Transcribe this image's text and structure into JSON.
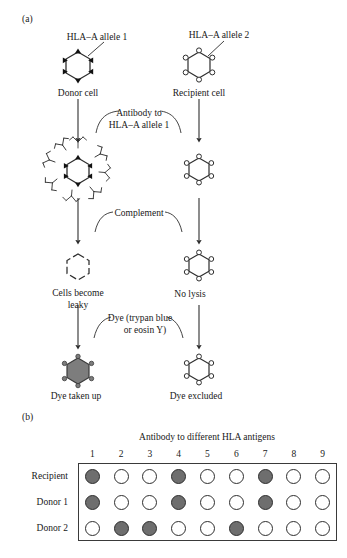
{
  "figure": {
    "panel_a": {
      "tag": "(a)",
      "labels": {
        "allele1": "HLA–A allele 1",
        "allele2": "HLA–A allele 2",
        "donor_cell": "Donor cell",
        "recipient_cell": "Recipient cell",
        "step1_line1": "Antibody to",
        "step1_line2": "HLA–A allele 1",
        "step2": "Complement",
        "left_outcome_line1": "Cells become",
        "left_outcome_line2": "leaky",
        "right_outcome": "No lysis",
        "step3_line1": "Dye (trypan blue",
        "step3_line2": "or eosin Y)",
        "left_result": "Dye taken up",
        "right_result": "Dye excluded"
      },
      "colors": {
        "stroke": "#2e2e2e",
        "dye_fill": "#7d7d7d",
        "antigen_fill": "#111111"
      }
    },
    "panel_b": {
      "tag": "(b)",
      "title": "Antibody to different HLA antigens",
      "columns": [
        "1",
        "2",
        "3",
        "4",
        "5",
        "6",
        "7",
        "8",
        "9"
      ],
      "rows": [
        {
          "label": "Recipient",
          "wells": [
            1,
            0,
            0,
            1,
            0,
            0,
            1,
            0,
            0
          ]
        },
        {
          "label": "Donor 1",
          "wells": [
            1,
            0,
            0,
            1,
            0,
            0,
            1,
            0,
            0
          ]
        },
        {
          "label": "Donor 2",
          "wells": [
            0,
            1,
            1,
            0,
            0,
            1,
            0,
            0,
            0
          ]
        }
      ],
      "colors": {
        "well_positive": "#6e6e6e",
        "well_negative": "#ffffff",
        "border": "#3a3a3a"
      }
    }
  }
}
